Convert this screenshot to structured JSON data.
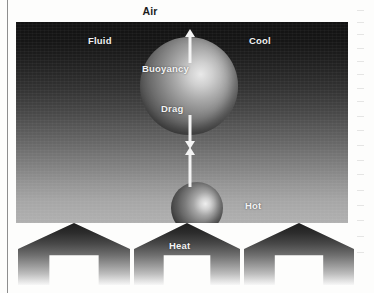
{
  "figure": {
    "ambient_label": "Air"
  },
  "panel": {
    "labels": {
      "fluid": "Fluid",
      "cool": "Cool",
      "hot": "Hot",
      "buoyancy": "Buoyancy",
      "drag": "Drag"
    },
    "gradient": {
      "top_color": "#121212",
      "bottom_color": "#b0b0b0",
      "top_meaning": "Cool",
      "bottom_meaning": "Hot"
    }
  },
  "arrows": [
    {
      "name": "buoyancy-arrow",
      "direction": "up",
      "label": "Buoyancy",
      "color": "#f4f4f4"
    },
    {
      "name": "drag-arrow",
      "direction": "down",
      "label": "Drag",
      "color": "#f4f4f4"
    },
    {
      "name": "rise-arrow",
      "direction": "up",
      "label": "",
      "color": "#f4f4f4"
    }
  ],
  "spheres": [
    {
      "name": "large-parcel",
      "size": "large",
      "highlight": "upper-right"
    },
    {
      "name": "small-parcel",
      "size": "small",
      "highlight": "upper-right"
    }
  ],
  "heat": {
    "label": "Heat",
    "arrow_count": 3,
    "direction": "up"
  }
}
